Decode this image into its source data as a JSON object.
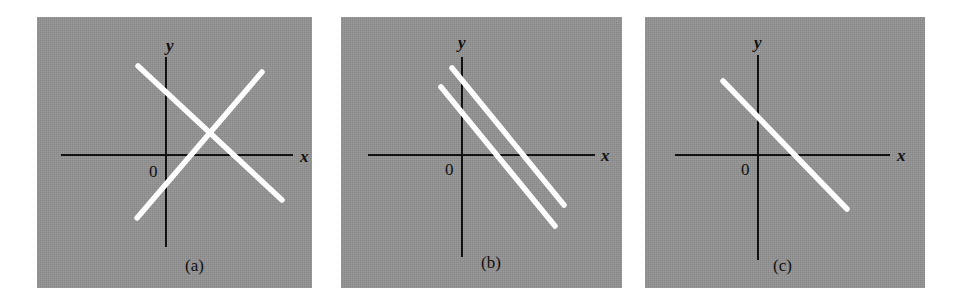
{
  "figure": {
    "width": 959,
    "height": 305,
    "background": "#ffffff",
    "panel_background": "#939393",
    "axis_color": "#111111",
    "line_color": "#fdfdfd"
  },
  "chart_data": {
    "type": "line",
    "title": "",
    "panels": [
      {
        "id": "a",
        "caption": "(a)",
        "xlabel": "x",
        "ylabel": "y",
        "origin_label": "0",
        "box": {
          "x": 37,
          "y": 17,
          "w": 275,
          "h": 271
        },
        "axes": {
          "x_axis_y": 137,
          "x_axis_x1": 24,
          "x_axis_x2": 256,
          "y_axis_x": 128,
          "y_axis_y1": 40,
          "y_axis_y2": 230
        },
        "series": [
          {
            "name": "line-1",
            "slope": "negative",
            "points": [
              {
                "x": 101,
                "y": 49
              },
              {
                "x": 245,
                "y": 183
              }
            ]
          },
          {
            "name": "line-2",
            "slope": "positive",
            "points": [
              {
                "x": 100,
                "y": 201
              },
              {
                "x": 225,
                "y": 55
              }
            ]
          }
        ],
        "labels": {
          "x": {
            "x": 263,
            "y": 131
          },
          "y": {
            "x": 129,
            "y": 20
          },
          "origin": {
            "x": 112,
            "y": 146
          },
          "caption": {
            "x": 148,
            "y": 240
          }
        }
      },
      {
        "id": "b",
        "caption": "(b)",
        "xlabel": "x",
        "ylabel": "y",
        "origin_label": "0",
        "box": {
          "x": 341,
          "y": 17,
          "w": 281,
          "h": 271
        },
        "axes": {
          "x_axis_y": 137,
          "x_axis_x1": 27,
          "x_axis_x2": 254,
          "y_axis_x": 120,
          "y_axis_y1": 40,
          "y_axis_y2": 240
        },
        "series": [
          {
            "name": "line-1",
            "slope": "negative",
            "points": [
              {
                "x": 111,
                "y": 51
              },
              {
                "x": 223,
                "y": 188
              }
            ]
          },
          {
            "name": "line-2",
            "slope": "negative",
            "points": [
              {
                "x": 100,
                "y": 70
              },
              {
                "x": 214,
                "y": 209
              }
            ]
          }
        ],
        "labels": {
          "x": {
            "x": 260,
            "y": 130
          },
          "y": {
            "x": 117,
            "y": 17
          },
          "origin": {
            "x": 104,
            "y": 144
          },
          "caption": {
            "x": 140,
            "y": 237
          }
        }
      },
      {
        "id": "c",
        "caption": "(c)",
        "xlabel": "x",
        "ylabel": "y",
        "origin_label": "0",
        "box": {
          "x": 645,
          "y": 17,
          "w": 280,
          "h": 271
        },
        "axes": {
          "x_axis_y": 137,
          "x_axis_x1": 30,
          "x_axis_x2": 245,
          "y_axis_x": 112,
          "y_axis_y1": 38,
          "y_axis_y2": 243
        },
        "series": [
          {
            "name": "line-1",
            "slope": "negative",
            "points": [
              {
                "x": 78,
                "y": 64
              },
              {
                "x": 202,
                "y": 192
              }
            ]
          }
        ],
        "labels": {
          "x": {
            "x": 252,
            "y": 130
          },
          "y": {
            "x": 109,
            "y": 17
          },
          "origin": {
            "x": 96,
            "y": 144
          },
          "caption": {
            "x": 128,
            "y": 240
          }
        }
      }
    ]
  }
}
